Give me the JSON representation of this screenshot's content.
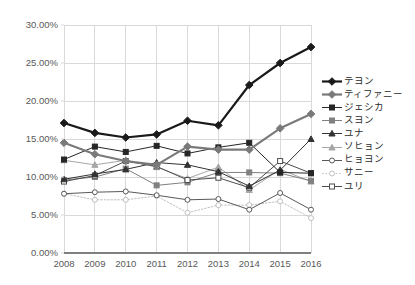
{
  "chart_data": {
    "type": "line",
    "title": "",
    "xlabel": "",
    "ylabel": "",
    "categories": [
      "2008",
      "2009",
      "2010",
      "2011",
      "2012",
      "2013",
      "2014",
      "2015",
      "2016"
    ],
    "x": [
      2008,
      2009,
      2010,
      2011,
      2012,
      2013,
      2014,
      2015,
      2016
    ],
    "ylim": [
      0,
      30
    ],
    "ytick_labels": [
      "0.00%",
      "5.00%",
      "10.00%",
      "15.00%",
      "20.00%",
      "25.00%",
      "30.00%"
    ],
    "ytick_values": [
      0,
      5,
      10,
      15,
      20,
      25,
      30
    ],
    "grid": true,
    "legend_position": "right",
    "series": [
      {
        "name": "テヨン",
        "color": "#1a1a1a",
        "marker": "diamond",
        "marker_filled": true,
        "line_width": 2.2,
        "dashed": false,
        "values": [
          17.1,
          15.8,
          15.2,
          15.6,
          17.4,
          16.8,
          22.1,
          25.0,
          27.1
        ]
      },
      {
        "name": "ティファニー",
        "color": "#7a7a7a",
        "marker": "diamond",
        "marker_filled": true,
        "line_width": 2.2,
        "dashed": false,
        "values": [
          14.5,
          13.0,
          12.1,
          11.6,
          14.0,
          13.6,
          13.6,
          16.4,
          18.3
        ]
      },
      {
        "name": "ジェシカ",
        "color": "#262626",
        "marker": "square",
        "marker_filled": true,
        "line_width": 1.0,
        "dashed": false,
        "values": [
          12.3,
          14.0,
          13.3,
          14.1,
          13.1,
          13.9,
          14.5,
          10.6,
          10.5
        ]
      },
      {
        "name": "スヨン",
        "color": "#808080",
        "marker": "square",
        "marker_filled": true,
        "line_width": 1.0,
        "dashed": false,
        "values": [
          9.6,
          10.0,
          11.1,
          8.9,
          9.3,
          10.6,
          10.6,
          10.5,
          9.5
        ]
      },
      {
        "name": "ユナ",
        "color": "#333333",
        "marker": "triangle",
        "marker_filled": true,
        "line_width": 1.0,
        "dashed": false,
        "values": [
          9.7,
          10.4,
          11.0,
          11.9,
          11.6,
          10.7,
          8.8,
          10.9,
          15.0
        ]
      },
      {
        "name": "ソヒョン",
        "color": "#a6a6a6",
        "marker": "triangle",
        "marker_filled": true,
        "line_width": 1.0,
        "dashed": false,
        "values": [
          12.2,
          11.6,
          12.2,
          11.3,
          9.8,
          11.3,
          8.3,
          11.0,
          9.4
        ]
      },
      {
        "name": "ヒョヨン",
        "color": "#595959",
        "marker": "circle",
        "marker_filled": false,
        "line_width": 1.0,
        "dashed": false,
        "values": [
          7.8,
          8.0,
          8.1,
          7.6,
          7.0,
          7.1,
          5.7,
          7.9,
          5.7
        ]
      },
      {
        "name": "サニー",
        "color": "#c0c0c0",
        "marker": "circle",
        "marker_filled": false,
        "line_width": 1.0,
        "dashed": true,
        "values": [
          7.8,
          7.0,
          7.0,
          7.5,
          5.3,
          6.3,
          6.3,
          6.8,
          4.6
        ]
      },
      {
        "name": "ユリ",
        "color": "#4d4d4d",
        "marker": "square",
        "marker_filled": false,
        "line_width": 1.0,
        "dashed": false,
        "values": [
          9.4,
          10.2,
          12.1,
          11.4,
          9.6,
          9.9,
          8.6,
          12.1,
          10.5
        ]
      }
    ]
  },
  "axis": {
    "xtick_labels": [
      "2008",
      "2009",
      "2010",
      "2011",
      "2012",
      "2013",
      "2014",
      "2015",
      "2016"
    ],
    "ytick_labels": [
      "30.00%",
      "25.00%",
      "20.00%",
      "15.00%",
      "10.00%",
      "5.00%",
      "0.00%"
    ]
  },
  "legend": {
    "items": [
      {
        "label": "テヨン"
      },
      {
        "label": "ティファニー"
      },
      {
        "label": "ジェシカ"
      },
      {
        "label": "スヨン"
      },
      {
        "label": "ユナ"
      },
      {
        "label": "ソヒョン"
      },
      {
        "label": "ヒョヨン"
      },
      {
        "label": "サニー"
      },
      {
        "label": "ユリ"
      }
    ]
  },
  "colors": {
    "grid": "#d9d9d9",
    "axis": "#808080",
    "tick_text": "#595959",
    "legend_text": "#2b2b2b",
    "background": "#ffffff"
  }
}
